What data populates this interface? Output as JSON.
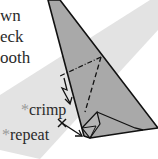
{
  "instruction_text_lines": [
    "wn",
    "eck",
    "ooth"
  ],
  "labels": {
    "crimp": {
      "marker": "*",
      "text": "crimp"
    },
    "repeat": {
      "marker": "*",
      "text": "repeat"
    }
  },
  "colors": {
    "paper": "#a9a9a9",
    "band": "#e3e3e3",
    "line": "#111111",
    "marker": "#9a9a9a"
  }
}
